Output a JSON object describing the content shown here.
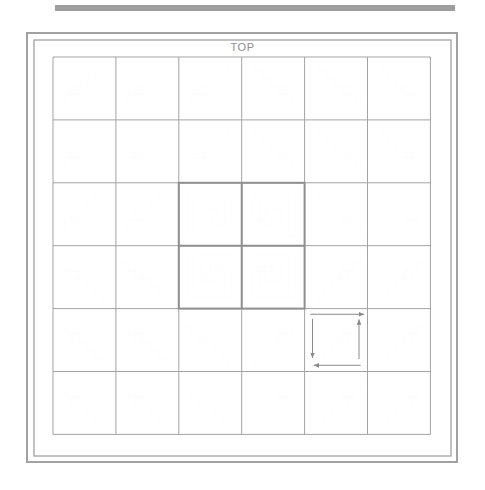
{
  "page": {
    "background_color": "#ffffff",
    "width": 485,
    "height": 490
  },
  "header_bar": {
    "name": "top-gray-bar",
    "color": "#9d9d9d",
    "x": 55,
    "y": 5,
    "width": 400,
    "height": 6
  },
  "labels": {
    "top": "TOP"
  },
  "frame": {
    "outer": {
      "x": 27,
      "y": 33,
      "width": 430,
      "height": 429,
      "color": "#a2a2a2",
      "stroke": 2
    },
    "inner": {
      "x": 34,
      "y": 40,
      "width": 417,
      "height": 416,
      "color": "#a8a8a8",
      "stroke": 1.4
    }
  },
  "grid": {
    "origin_x": 53,
    "origin_y": 57,
    "cell": 62.9,
    "cols": 6,
    "rows": 6,
    "line_color": "#a3a3a3",
    "line_width": 1
  },
  "colors": {
    "line": "#9a9a9a",
    "line_light": "#b0b0b0",
    "line_dark": "#8a8a8a",
    "center_block": "#8f8f8f",
    "arrow": "#8a8a8a",
    "text": "#8e8e8e",
    "background": "#ffffff"
  },
  "center_block": {
    "name": "center-medallion",
    "cols": [
      2,
      3
    ],
    "rows": [
      2,
      3
    ],
    "stroke": "#8f8f8f",
    "stroke_width": 2,
    "description": "2x2 block of concentric spiral squares"
  },
  "chart_data": {
    "type": "diagram",
    "pattern": "log-cabin / courthouse-steps radiating staircase blocks",
    "grid_size": "6x6",
    "tile_motif": "three-step staircase with square notch",
    "center_motif": "concentric nested square spiral",
    "annotations": [
      "TOP"
    ],
    "arrow_flow": {
      "tile": "center-bottom-right",
      "direction": "counterclockwise spiral inward",
      "segments": [
        {
          "name": "arrow-top-right",
          "dir": "right"
        },
        {
          "name": "arrow-right-up",
          "dir": "up"
        },
        {
          "name": "arrow-bottom-left",
          "dir": "left"
        },
        {
          "name": "arrow-left-down",
          "dir": "down"
        }
      ]
    },
    "quadrant_orientations": [
      {
        "quadrant": "top-left",
        "flip_x": false,
        "flip_y": false
      },
      {
        "quadrant": "top-right",
        "flip_x": true,
        "flip_y": false
      },
      {
        "quadrant": "bottom-left",
        "flip_x": false,
        "flip_y": true
      },
      {
        "quadrant": "bottom-right",
        "flip_x": true,
        "flip_y": true
      }
    ]
  }
}
